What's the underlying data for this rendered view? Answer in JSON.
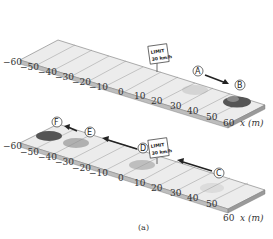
{
  "figure": {
    "caption": "(a)",
    "axis_label": "x (m)",
    "ticks": [
      "−60",
      "−50",
      "−40",
      "−30",
      "−20",
      "−10",
      "0",
      "10",
      "20",
      "30",
      "40",
      "50",
      "60"
    ],
    "sign": {
      "line1": "LIMIT",
      "line2": "30 km/h"
    },
    "top_panel": {
      "points": [
        "A",
        "B"
      ],
      "arrow_direction": "positive x"
    },
    "bottom_panel": {
      "points": [
        "C",
        "D",
        "E",
        "F"
      ],
      "arrow_direction": "negative x"
    }
  }
}
